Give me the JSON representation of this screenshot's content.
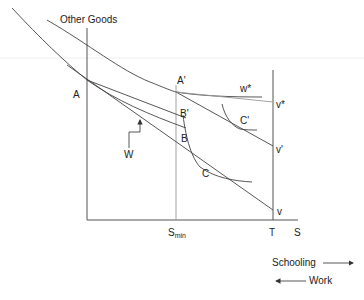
{
  "diagram": {
    "y_axis_label": "Other Goods",
    "x_axis_label": "S",
    "tick_labels": {
      "s_min_main": "S",
      "s_min_sub": "min",
      "t": "T"
    },
    "points": {
      "A": "A",
      "A_prime": "A'",
      "B": "B",
      "B_prime": "B'",
      "C": "C",
      "C_prime": "C'",
      "v": "v",
      "v_prime": "v'",
      "v_star": "v*",
      "w_star": "w*",
      "W": "W"
    },
    "legend": {
      "schooling": "Schooling",
      "work": "Work"
    }
  }
}
